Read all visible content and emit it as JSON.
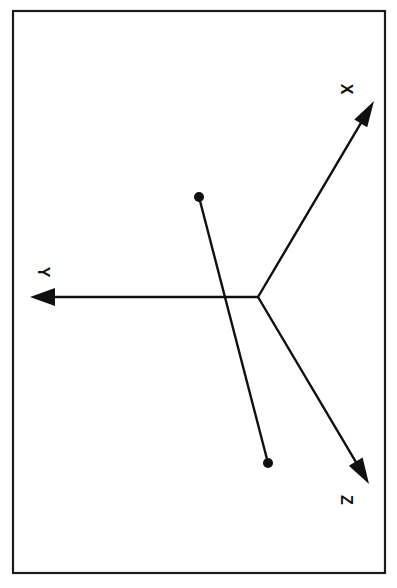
{
  "figure": {
    "kind": "3d-coordinate-axes-diagram",
    "orientation_note": "page rotated 90 degrees clockwise; labels read sideways",
    "background_color": "#ffffff",
    "ink_color": "#101010",
    "frame": {
      "name": "page-border",
      "x": 13,
      "y": 11,
      "width": 372,
      "height": 562,
      "stroke_width": 2.2,
      "stroke_color": "#1a1a1a",
      "fill": "#ffffff"
    },
    "origin": {
      "label": "O",
      "x": 258,
      "y": 297
    },
    "axes": [
      {
        "id": "x",
        "label": "X",
        "from": {
          "x": 258,
          "y": 297
        },
        "to": {
          "x": 374,
          "y": 101
        },
        "stroke_width": 2.4,
        "arrow": "filled-triangle",
        "label_pos": {
          "x": 345,
          "y": 89
        },
        "label_rotation_deg": 90
      },
      {
        "id": "y",
        "label": "Y",
        "from": {
          "x": 258,
          "y": 297
        },
        "to": {
          "x": 30,
          "y": 297
        },
        "stroke_width": 2.4,
        "arrow": "filled-triangle",
        "label_pos": {
          "x": 42,
          "y": 272
        },
        "label_rotation_deg": 90
      },
      {
        "id": "z",
        "label": "Z",
        "from": {
          "x": 258,
          "y": 297
        },
        "to": {
          "x": 369,
          "y": 484
        },
        "stroke_width": 2.4,
        "arrow": "filled-triangle",
        "label_pos": {
          "x": 345,
          "y": 500
        },
        "label_rotation_deg": 90
      }
    ],
    "segment": {
      "id": "rod",
      "description": "straight line segment with round end markers at both tips, crossing the Y axis",
      "stroke_width": 2.4,
      "endpoints": [
        {
          "id": "end-a",
          "x": 199,
          "y": 197,
          "marker": "filled-circle",
          "marker_radius": 5.0
        },
        {
          "id": "end-b",
          "x": 268,
          "y": 463,
          "marker": "filled-circle",
          "marker_radius": 5.0
        }
      ],
      "crosses_axis": "y"
    }
  }
}
